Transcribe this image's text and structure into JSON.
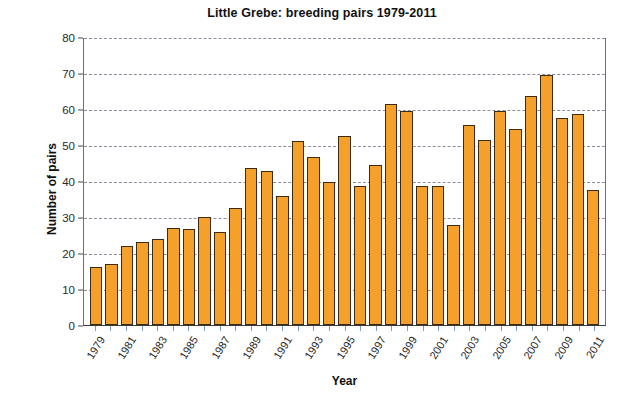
{
  "chart_data": {
    "type": "bar",
    "title": "Little Grebe: breeding pairs 1979-2011",
    "xlabel": "Year",
    "ylabel": "Number of pairs",
    "ylim": [
      0,
      80
    ],
    "ytick_step": 10,
    "yticks": [
      0,
      10,
      20,
      30,
      40,
      50,
      60,
      70,
      80
    ],
    "ytick_labels": [
      "0",
      "10",
      "20",
      "30",
      "40",
      "50",
      "60",
      "70",
      "80"
    ],
    "grid": true,
    "legend": false,
    "bar_color": "#F5A02A",
    "bar_edge_color": "#3d2a12",
    "categories": [
      "1979",
      "1980",
      "1981",
      "1982",
      "1983",
      "1984",
      "1985",
      "1986",
      "1987",
      "1988",
      "1989",
      "1990",
      "1991",
      "1992",
      "1993",
      "1994",
      "1995",
      "1996",
      "1997",
      "1998",
      "1999",
      "2000",
      "2001",
      "2002",
      "2003",
      "2004",
      "2005",
      "2006",
      "2007",
      "2008",
      "2009",
      "2010",
      "2011"
    ],
    "xtick_labels_shown": [
      "1979",
      "1981",
      "1983",
      "1985",
      "1987",
      "1989",
      "1991",
      "1993",
      "1995",
      "1997",
      "1999",
      "2001",
      "2003",
      "2005",
      "2007",
      "2009",
      "2011"
    ],
    "values": [
      16,
      17,
      22,
      23,
      24,
      27,
      26.7,
      30,
      25.8,
      32.5,
      43.5,
      42.8,
      35.8,
      51,
      46.8,
      39.7,
      52.5,
      38.5,
      44.5,
      61.5,
      59.5,
      38.7,
      38.7,
      27.8,
      55.5,
      51.5,
      59.5,
      54.5,
      63.5,
      69.5,
      57.5,
      58.5,
      37.5
    ]
  }
}
